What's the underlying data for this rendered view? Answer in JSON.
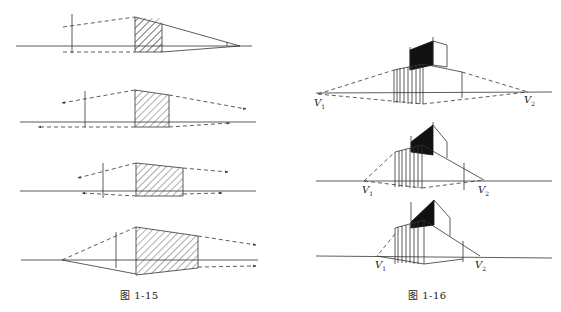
{
  "figures": [
    {
      "id": "fig-1-15",
      "caption": "图 1-15",
      "panels": 4,
      "description": "Four horizontal perspective sketches of a hatched rectangle with converging dashed construction lines and arrows"
    },
    {
      "id": "fig-1-16",
      "caption": "图 1-16",
      "panels": 3,
      "description": "Three two-point perspective views of a building block with a dark roof volume",
      "vanishing_points": [
        {
          "label": "V",
          "sub": "1"
        },
        {
          "label": "V",
          "sub": "2"
        }
      ]
    }
  ],
  "colors": {
    "line": "#333333",
    "fill_dark": "#111111",
    "background": "#ffffff"
  }
}
